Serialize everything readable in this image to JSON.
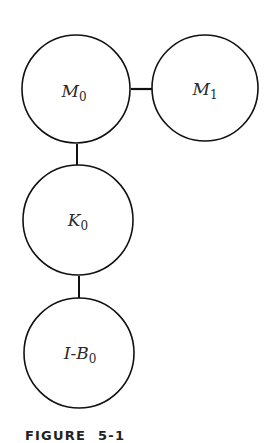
{
  "diagram": {
    "nodes": [
      {
        "id": "M0",
        "label": "M",
        "sub": "0"
      },
      {
        "id": "M1",
        "label": "M",
        "sub": "1"
      },
      {
        "id": "K0",
        "label": "K",
        "sub": "0"
      },
      {
        "id": "IB0",
        "label": "I-B",
        "sub": "0"
      }
    ],
    "edges": [
      {
        "from": "M0",
        "to": "M1"
      },
      {
        "from": "M0",
        "to": "K0"
      },
      {
        "from": "K0",
        "to": "IB0"
      }
    ]
  },
  "caption": {
    "word": "FIGURE",
    "number": "5-1"
  }
}
